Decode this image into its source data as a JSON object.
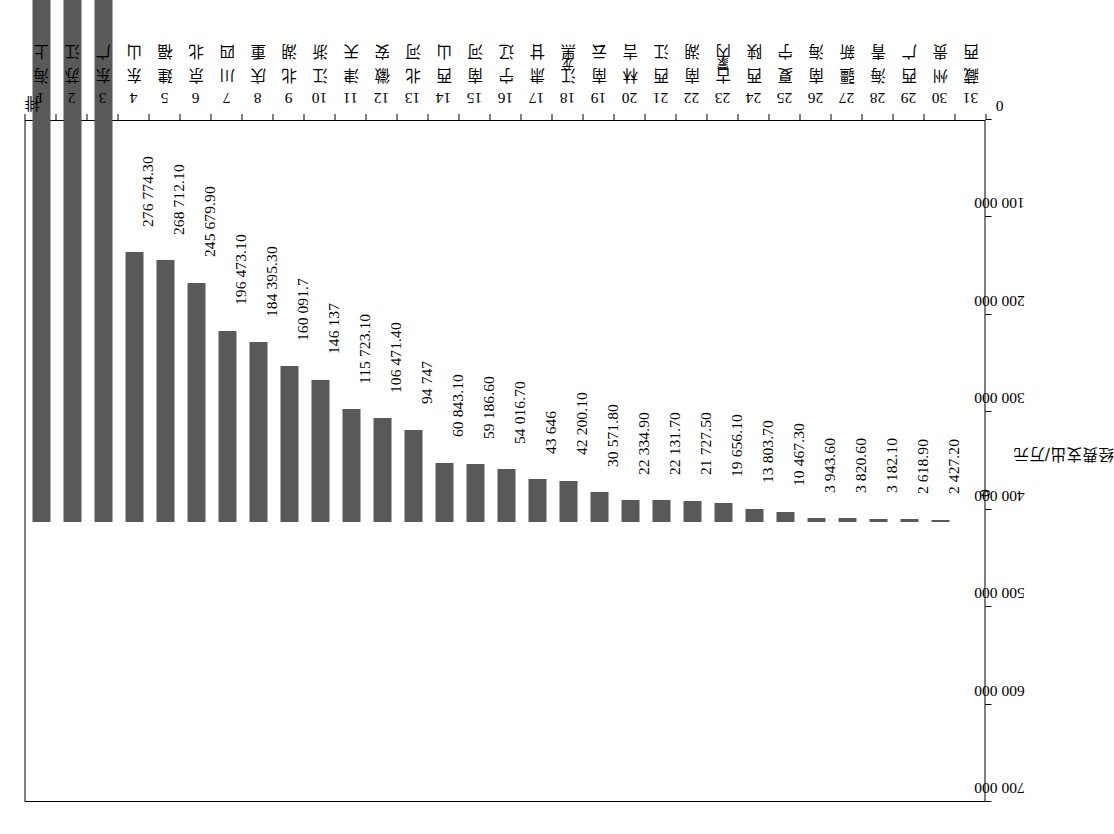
{
  "chart_data": {
    "type": "bar",
    "title": "",
    "orientation": "vertical-rotated",
    "xlabel": "",
    "ylabel": "经费支出/万元",
    "ylim": [
      0,
      700000
    ],
    "ytick_step": 100000,
    "ytick_labels": [
      "0",
      "100 000",
      "200 000",
      "300 000",
      "400 000",
      "500 000",
      "600 000",
      "700 000"
    ],
    "ytick_values": [
      0,
      100000,
      200000,
      300000,
      400000,
      500000,
      600000,
      700000
    ],
    "grid": false,
    "legend": null,
    "bar_color": "#595959",
    "axis_header": {
      "rank": "排",
      "name": "名"
    },
    "categories": [
      "上海",
      "江苏",
      "广东",
      "山东",
      "福建",
      "北京",
      "四川",
      "重庆",
      "湖北",
      "浙江",
      "天津",
      "安徽",
      "河北",
      "山西",
      "河南",
      "辽宁",
      "甘肃",
      "黑龙江",
      "云南",
      "吉林",
      "江西",
      "湖南",
      "内蒙古",
      "陕西",
      "宁夏",
      "海南",
      "新疆",
      "青海",
      "广西",
      "贵州",
      "西藏"
    ],
    "ranks": [
      "1",
      "2",
      "3",
      "4",
      "5",
      "6",
      "7",
      "8",
      "9",
      "10",
      "11",
      "12",
      "13",
      "14",
      "15",
      "16",
      "17",
      "18",
      "19",
      "20",
      "21",
      "22",
      "23",
      "24",
      "25",
      "26",
      "27",
      "28",
      "29",
      "30",
      "31"
    ],
    "values": [
      583135.3,
      574414.7,
      569733.4,
      276774.3,
      268712.1,
      245679.9,
      196473.1,
      184395.3,
      160091.7,
      146137,
      115723.1,
      106471.4,
      94747,
      60843.1,
      59186.6,
      54016.7,
      43646,
      42200.1,
      30571.8,
      22334.9,
      22131.7,
      21727.5,
      19656.1,
      13803.7,
      10467.3,
      3943.6,
      3820.6,
      3182.1,
      2618.9,
      2427.2,
      0
    ],
    "value_labels": [
      "583 135.30",
      "574 414.70",
      "569 733.40",
      "276 774.30",
      "268 712.10",
      "245 679.90",
      "196 473.10",
      "184 395.30",
      "160 091.7",
      "146 137",
      "115 723.10",
      "106 471.40",
      "94 747",
      "60 843.10",
      "59 186.60",
      "54 016.70",
      "43 646",
      "42 200.10",
      "30 571.80",
      "22 334.90",
      "22 131.70",
      "21 727.50",
      "19 656.10",
      "13 803.70",
      "10 467.30",
      "3 943.60",
      "3 820.60",
      "3 182.10",
      "2 618.90",
      "2 427.20",
      "0"
    ]
  }
}
